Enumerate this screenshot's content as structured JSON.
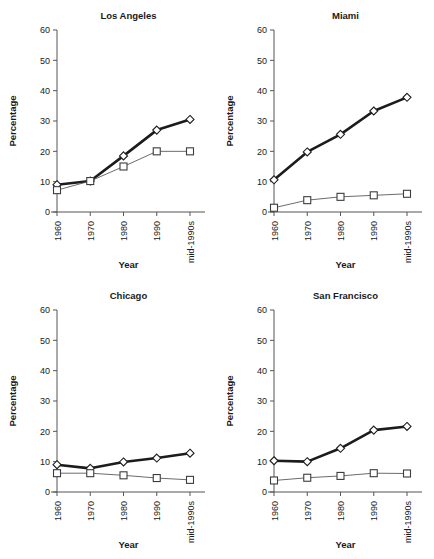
{
  "figure": {
    "name": "small-multiples-line-chart",
    "panel_count": 4
  },
  "axis": {
    "ylabel": "Percentage",
    "xlabel": "Year",
    "yticks": [
      "0",
      "10",
      "20",
      "30",
      "40",
      "50",
      "60"
    ],
    "xticks": [
      "1960",
      "1970",
      "1980",
      "1990",
      "mid-1990s"
    ]
  },
  "titles": {
    "los_angeles": "Los Angeles",
    "miami": "Miami",
    "chicago": "Chicago",
    "san_francisco": "San Francisco"
  },
  "colors": {
    "series_thick": "#1c1c1c",
    "series_thin": "#5a5a5a",
    "axis": "#555555",
    "marker_fill": "#ffffff",
    "background": "#ffffff",
    "text": "#1a1a1a"
  },
  "chart_data": [
    {
      "type": "line",
      "title": "Los Angeles",
      "xlabel": "Year",
      "ylabel": "Percentage",
      "categories": [
        "1960",
        "1970",
        "1980",
        "1990",
        "mid-1990s"
      ],
      "ylim": [
        0,
        60
      ],
      "yticks": [
        0,
        10,
        20,
        30,
        40,
        50,
        60
      ],
      "grid": false,
      "legend": "none",
      "series": [
        {
          "name": "diamond-series",
          "marker": "diamond",
          "line": "thick",
          "values": [
            9.0,
            10.2,
            18.5,
            27.0,
            30.5
          ]
        },
        {
          "name": "square-series",
          "marker": "square",
          "line": "thin",
          "values": [
            7.2,
            10.2,
            15.0,
            20.0,
            20.0
          ]
        }
      ]
    },
    {
      "type": "line",
      "title": "Miami",
      "xlabel": "Year",
      "ylabel": "Percentage",
      "categories": [
        "1960",
        "1970",
        "1980",
        "1990",
        "mid-1990s"
      ],
      "ylim": [
        0,
        60
      ],
      "yticks": [
        0,
        10,
        20,
        30,
        40,
        50,
        60
      ],
      "grid": false,
      "legend": "none",
      "series": [
        {
          "name": "diamond-series",
          "marker": "diamond",
          "line": "thick",
          "values": [
            10.6,
            19.8,
            25.6,
            33.3,
            37.8
          ]
        },
        {
          "name": "square-series",
          "marker": "square",
          "line": "thin",
          "values": [
            1.4,
            3.9,
            5.0,
            5.5,
            6.0
          ]
        }
      ]
    },
    {
      "type": "line",
      "title": "Chicago",
      "xlabel": "Year",
      "ylabel": "Percentage",
      "categories": [
        "1960",
        "1970",
        "1980",
        "1990",
        "mid-1990s"
      ],
      "ylim": [
        0,
        60
      ],
      "yticks": [
        0,
        10,
        20,
        30,
        40,
        50,
        60
      ],
      "grid": false,
      "legend": "none",
      "series": [
        {
          "name": "diamond-series",
          "marker": "diamond",
          "line": "thick",
          "values": [
            9.0,
            7.8,
            9.9,
            11.2,
            12.8
          ]
        },
        {
          "name": "square-series",
          "marker": "square",
          "line": "thin",
          "values": [
            6.2,
            6.2,
            5.5,
            4.6,
            4.0
          ]
        }
      ]
    },
    {
      "type": "line",
      "title": "San Francisco",
      "xlabel": "Year",
      "ylabel": "Percentage",
      "categories": [
        "1960",
        "1970",
        "1980",
        "1990",
        "mid-1990s"
      ],
      "ylim": [
        0,
        60
      ],
      "yticks": [
        0,
        10,
        20,
        30,
        40,
        50,
        60
      ],
      "grid": false,
      "legend": "none",
      "series": [
        {
          "name": "diamond-series",
          "marker": "diamond",
          "line": "thick",
          "values": [
            10.3,
            10.0,
            14.4,
            20.4,
            21.6
          ]
        },
        {
          "name": "square-series",
          "marker": "square",
          "line": "thin",
          "values": [
            3.8,
            4.7,
            5.3,
            6.2,
            6.1
          ]
        }
      ]
    }
  ]
}
